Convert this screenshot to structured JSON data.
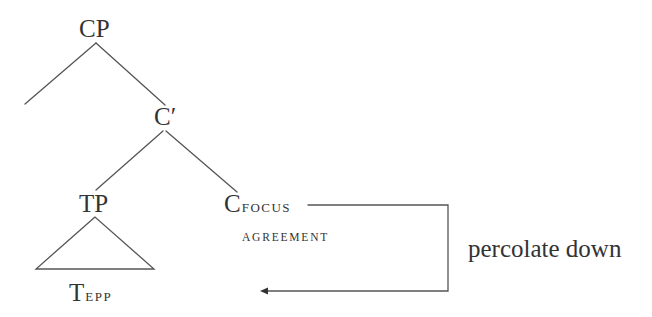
{
  "diagram": {
    "type": "syntax-tree",
    "nodes": {
      "cp": {
        "label": "CP"
      },
      "c_bar": {
        "label": "C′"
      },
      "tp": {
        "label": "TP"
      },
      "c_focus": {
        "head": "C",
        "subscript": "FOCUS",
        "feature": "AGREEMENT"
      },
      "t_epp": {
        "head": "T",
        "subscript": "EPP"
      }
    },
    "edges": [
      {
        "from": "CP",
        "to": "(empty specifier)"
      },
      {
        "from": "CP",
        "to": "C′"
      },
      {
        "from": "C′",
        "to": "TP"
      },
      {
        "from": "C′",
        "to": "C_FOCUS"
      },
      {
        "from": "TP",
        "to": "T_EPP",
        "style": "triangle"
      }
    ],
    "arrow": {
      "from": "C_FOCUS",
      "to": "T_EPP",
      "label": "percolate down"
    },
    "colors": {
      "line": "#555555",
      "text": "#333333",
      "background": "#ffffff"
    }
  }
}
